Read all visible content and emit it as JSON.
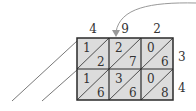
{
  "diagram": {
    "type": "lattice-multiplication",
    "top_digits": [
      "4",
      "9",
      "2"
    ],
    "right_digits": [
      "3",
      "4"
    ],
    "cells": [
      [
        {
          "tens": "1",
          "units": "2"
        },
        {
          "tens": "2",
          "units": "7"
        },
        {
          "tens": "0",
          "units": "6"
        }
      ],
      [
        {
          "tens": "1",
          "units": "6"
        },
        {
          "tens": "3",
          "units": "6"
        },
        {
          "tens": "0",
          "units": "8"
        }
      ]
    ],
    "colors": {
      "cell_fill": "#dcdcdc",
      "grid_line": "#2a2a2a",
      "arrow": "#999999",
      "text": "#333333"
    }
  }
}
